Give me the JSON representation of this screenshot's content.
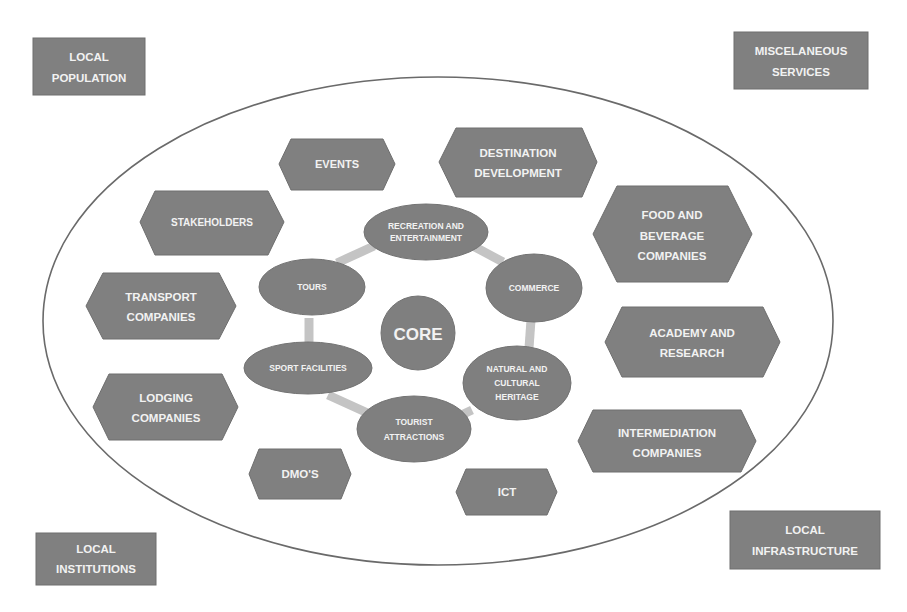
{
  "diagram": {
    "title": "",
    "corner_boxes": [
      {
        "id": "local-population",
        "lines": [
          "LOCAL",
          "POPULATION"
        ]
      },
      {
        "id": "miscelaneous-services",
        "lines": [
          "MISCELANEOUS",
          "SERVICES"
        ]
      },
      {
        "id": "local-institutions",
        "lines": [
          "LOCAL",
          "INSTITUTIONS"
        ]
      },
      {
        "id": "local-infrastructure",
        "lines": [
          "LOCAL",
          "INFRASTRUCTURE"
        ]
      }
    ],
    "hexagons": [
      {
        "id": "events",
        "lines": [
          "EVENTS"
        ]
      },
      {
        "id": "destination-development",
        "lines": [
          "DESTINATION",
          "DEVELOPMENT"
        ]
      },
      {
        "id": "stakeholders",
        "lines": [
          "STAKEHOLDERS"
        ]
      },
      {
        "id": "food-and-beverage-companies",
        "lines": [
          "FOOD AND",
          "BEVERAGE",
          "COMPANIES"
        ]
      },
      {
        "id": "transport-companies",
        "lines": [
          "TRANSPORT",
          "COMPANIES"
        ]
      },
      {
        "id": "academy-and-research",
        "lines": [
          "ACADEMY AND",
          "RESEARCH"
        ]
      },
      {
        "id": "lodging-companies",
        "lines": [
          "LODGING",
          "COMPANIES"
        ]
      },
      {
        "id": "intermediation-companies",
        "lines": [
          "INTERMEDIATION",
          "COMPANIES"
        ]
      },
      {
        "id": "dmos",
        "lines": [
          "DMO'S"
        ]
      },
      {
        "id": "ict",
        "lines": [
          "ICT"
        ]
      }
    ],
    "core": {
      "label": "CORE"
    },
    "ring_nodes": [
      {
        "id": "recreation-and-entertainment",
        "lines": [
          "RECREATION AND",
          "ENTERTAINMENT"
        ]
      },
      {
        "id": "commerce",
        "lines": [
          "COMMERCE"
        ]
      },
      {
        "id": "natural-and-cultural-heritage",
        "lines": [
          "NATURAL AND",
          "CULTURAL",
          "HERITAGE"
        ]
      },
      {
        "id": "tourist-attractions",
        "lines": [
          "TOURIST",
          "ATTRACTIONS"
        ]
      },
      {
        "id": "sport-facilities",
        "lines": [
          "SPORT FACILITIES"
        ]
      },
      {
        "id": "tours",
        "lines": [
          "TOURS"
        ]
      }
    ],
    "colors": {
      "shape_fill": "#808080",
      "text": "#f2f2f2",
      "connector": "#c4c4c4",
      "outer_ellipse_stroke": "#6a6a6a",
      "background": "#ffffff"
    }
  }
}
